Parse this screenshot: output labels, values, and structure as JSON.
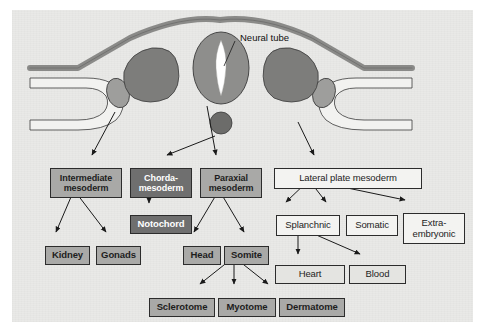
{
  "figure": {
    "title_visible": false,
    "background_color": "#e9e9e7",
    "page_color": "#ffffff"
  },
  "callouts": [
    {
      "id": "neural-tube",
      "label": "Neural tube",
      "x": 228,
      "y": 22
    }
  ],
  "anatomy": {
    "description": "Embryo cross-section showing ectoderm sheet, neural tube with lumen, paired paraxial mesoderm blocks, intermediate mesoderm, notochord and lateral plate mesoderm",
    "colors": {
      "ectoderm": "#8a8a88",
      "neural_tube": "#8e8e8c",
      "neural_lumen": "#ffffff",
      "paraxial": "#7d7d7b",
      "intermediate": "#9e9e9c",
      "notochord": "#6c6c6a",
      "lateral_plate_fill": "#f2f2f0"
    }
  },
  "nodes": [
    {
      "id": "intermediate-mesoderm",
      "label": "Intermediate\nmesoderm",
      "style": "mid",
      "x": 38,
      "y": 158,
      "w": 72,
      "h": 30,
      "font": 9.0
    },
    {
      "id": "chorda-mesoderm",
      "label": "Chorda-\nmesoderm",
      "style": "dark",
      "x": 118,
      "y": 158,
      "w": 62,
      "h": 30,
      "font": 9.0
    },
    {
      "id": "paraxial-mesoderm",
      "label": "Paraxial\nmesoderm",
      "style": "mid",
      "x": 188,
      "y": 158,
      "w": 62,
      "h": 30,
      "font": 9.0
    },
    {
      "id": "lateral-plate-mesoderm",
      "label": "Lateral plate mesoderm",
      "style": "white",
      "x": 262,
      "y": 158,
      "w": 148,
      "h": 21,
      "font": 9.5
    },
    {
      "id": "notochord",
      "label": "Notochord",
      "style": "dark",
      "x": 118,
      "y": 205,
      "w": 62,
      "h": 19,
      "font": 9.5
    },
    {
      "id": "splanchnic",
      "label": "Splanchnic",
      "style": "white",
      "x": 264,
      "y": 205,
      "w": 64,
      "h": 21,
      "font": 9.5
    },
    {
      "id": "somatic",
      "label": "Somatic",
      "style": "white",
      "x": 334,
      "y": 205,
      "w": 52,
      "h": 21,
      "font": 9.5
    },
    {
      "id": "extra-embryonic",
      "label": "Extra-\nembryonic",
      "style": "white",
      "x": 391,
      "y": 203,
      "w": 62,
      "h": 31,
      "font": 9.5
    },
    {
      "id": "kidney",
      "label": "Kidney",
      "style": "mid",
      "x": 33,
      "y": 236,
      "w": 45,
      "h": 19,
      "font": 9.5
    },
    {
      "id": "gonads",
      "label": "Gonads",
      "style": "mid",
      "x": 84,
      "y": 236,
      "w": 45,
      "h": 19,
      "font": 9.5
    },
    {
      "id": "head",
      "label": "Head",
      "style": "mid",
      "x": 171,
      "y": 236,
      "w": 38,
      "h": 19,
      "font": 9.5
    },
    {
      "id": "somite",
      "label": "Somite",
      "style": "mid",
      "x": 212,
      "y": 236,
      "w": 45,
      "h": 19,
      "font": 9.5
    },
    {
      "id": "heart",
      "label": "Heart",
      "style": "light",
      "x": 263,
      "y": 255,
      "w": 70,
      "h": 19,
      "font": 9.5
    },
    {
      "id": "blood",
      "label": "Blood",
      "style": "light",
      "x": 337,
      "y": 255,
      "w": 57,
      "h": 19,
      "font": 9.5
    },
    {
      "id": "sclerotome",
      "label": "Sclerotome",
      "style": "mid",
      "x": 137,
      "y": 288,
      "w": 66,
      "h": 19,
      "font": 9.5
    },
    {
      "id": "myotome",
      "label": "Myotome",
      "style": "mid",
      "x": 206,
      "y": 288,
      "w": 58,
      "h": 19,
      "font": 9.5
    },
    {
      "id": "dermatome",
      "label": "Dermatome",
      "style": "mid",
      "x": 267,
      "y": 288,
      "w": 66,
      "h": 19,
      "font": 9.5
    }
  ],
  "edges": [
    {
      "from": "embryo-intermediate",
      "to": "intermediate-mesoderm"
    },
    {
      "from": "embryo-notochord",
      "to": "chorda-mesoderm"
    },
    {
      "from": "embryo-paraxial",
      "to": "paraxial-mesoderm"
    },
    {
      "from": "embryo-lateral-plate",
      "to": "lateral-plate-mesoderm"
    },
    {
      "from": "intermediate-mesoderm",
      "to": "kidney"
    },
    {
      "from": "intermediate-mesoderm",
      "to": "gonads"
    },
    {
      "from": "chorda-mesoderm",
      "to": "notochord"
    },
    {
      "from": "paraxial-mesoderm",
      "to": "head"
    },
    {
      "from": "paraxial-mesoderm",
      "to": "somite"
    },
    {
      "from": "somite",
      "to": "sclerotome"
    },
    {
      "from": "somite",
      "to": "myotome"
    },
    {
      "from": "somite",
      "to": "dermatome"
    },
    {
      "from": "lateral-plate-mesoderm",
      "to": "splanchnic"
    },
    {
      "from": "lateral-plate-mesoderm",
      "to": "somatic"
    },
    {
      "from": "lateral-plate-mesoderm",
      "to": "extra-embryonic"
    },
    {
      "from": "splanchnic",
      "to": "heart"
    },
    {
      "from": "splanchnic",
      "to": "blood"
    }
  ]
}
